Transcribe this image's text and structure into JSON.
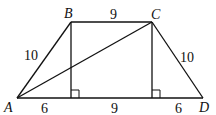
{
  "diagram": {
    "type": "trapezoid",
    "points": {
      "A": {
        "label": "A",
        "x": 17,
        "y": 98
      },
      "B": {
        "label": "B",
        "x": 71,
        "y": 22
      },
      "C": {
        "label": "C",
        "x": 152,
        "y": 22
      },
      "D": {
        "label": "D",
        "x": 203,
        "y": 98
      }
    },
    "lengths": {
      "AB": "10",
      "BC": "9",
      "CD": "10",
      "A_to_footB": "6",
      "footB_to_footC": "9",
      "footC_to_D": "6"
    },
    "segments": [
      "AB",
      "BC",
      "CD",
      "DA",
      "AC",
      "B-altitude",
      "C-altitude"
    ],
    "right_angle_markers": 2
  }
}
